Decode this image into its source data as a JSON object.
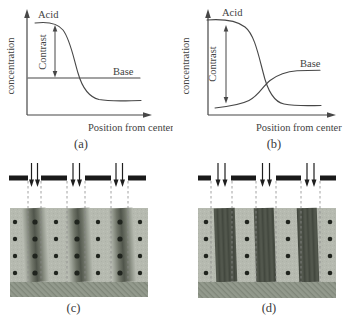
{
  "figure": {
    "panel_a": {
      "caption": "(a)",
      "y_axis_label": "concentration",
      "x_axis_label": "Position from center",
      "labels": {
        "acid": "Acid",
        "base": "Base",
        "contrast": "Contrast"
      }
    },
    "panel_b": {
      "caption": "(b)",
      "y_axis_label": "concentration",
      "x_axis_label": "Position from center",
      "labels": {
        "acid": "Acid",
        "base": "Base",
        "contrast": "Contrast"
      }
    },
    "panel_c": {
      "caption": "(c)"
    },
    "panel_d": {
      "caption": "(d)"
    },
    "colors": {
      "curve": "#474747",
      "text": "#424242",
      "mask_bar": "#1a1a1a",
      "exposure_arrow": "#1e1e1e",
      "dashed_guide": "#8a8a8a",
      "resist": "#b6bab0",
      "exposed_region_blurred": "#50554b",
      "exposed_region_sharp": "#4c5147",
      "substrate": "#939a8d",
      "acid_dot": "#20241e"
    }
  }
}
